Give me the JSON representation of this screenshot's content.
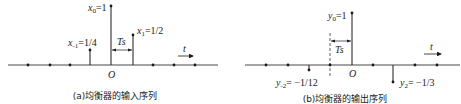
{
  "diagrams": [
    {
      "id": "a",
      "caption": "(a)均衡器的输入序列",
      "origin_label": "O",
      "time_axis_label": "t",
      "spacing_label": "Ts",
      "samples": [
        {
          "index": -1,
          "label_sym": "x",
          "label_sub": "-1",
          "label_val": "=1/4",
          "value": 0.25
        },
        {
          "index": 0,
          "label_sym": "x",
          "label_sub": "0",
          "label_val": "=1",
          "value": 1
        },
        {
          "index": 1,
          "label_sym": "x",
          "label_sub": "1",
          "label_val": "=1/2",
          "value": 0.5
        }
      ],
      "zero_sample_indices": [
        -4,
        -3,
        -2,
        2,
        3,
        4
      ]
    },
    {
      "id": "b",
      "caption": "(b)均衡器的输出序列",
      "origin_label": "O",
      "time_axis_label": "t",
      "spacing_label": "Ts",
      "samples": [
        {
          "index": -2,
          "label_sym": "y",
          "label_sub": "-2",
          "label_val": "= −1/12",
          "value": -0.0833
        },
        {
          "index": 0,
          "label_sym": "y",
          "label_sub": "0",
          "label_val": "=1",
          "value": 1
        },
        {
          "index": 2,
          "label_sym": "y",
          "label_sub": "2",
          "label_val": "= −1/3",
          "value": -0.3333
        }
      ],
      "zero_sample_indices": [
        -4,
        -3,
        -1,
        1,
        3,
        4
      ]
    }
  ],
  "colors": {
    "line": "#1a1a1a",
    "background": "#ffffff"
  }
}
